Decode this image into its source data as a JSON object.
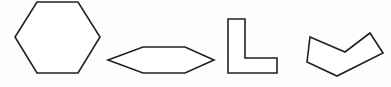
{
  "canvas": {
    "name": "geometric-shapes-figure",
    "width": 391,
    "height": 87,
    "background_color": "#fdfdfd",
    "stroke_color": "#231f20",
    "fill_color": "#ffffff",
    "stroke_width": 1.6
  },
  "shapes": [
    {
      "id": "hexagon",
      "label": "hexagon",
      "sides": 6,
      "points": "37,2 78,2 100,37 78,73 37,73 15,37"
    },
    {
      "id": "elongated-hexagon",
      "label": "elongated hexagon",
      "sides": 6,
      "points": "143,47 185,47 214,60 185,73 143,73 108,60"
    },
    {
      "id": "l-shape",
      "label": "L shape",
      "sides": 6,
      "points": "228,19 245,19 245,58 277,58 277,73 228,73"
    },
    {
      "id": "chevron",
      "label": "chevron",
      "sides": 6,
      "points": "310,37 345,52 370,33 383,53 337,76 307,62"
    }
  ]
}
